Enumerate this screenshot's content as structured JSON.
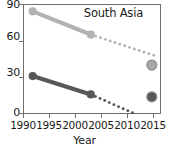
{
  "chart_data": {
    "type": "line",
    "title": "South Asia",
    "xlabel": "Year",
    "ylabel": "",
    "xlim": [
      1988,
      2016.5
    ],
    "ylim": [
      0,
      90
    ],
    "xticks": [
      1990,
      1995,
      2000,
      2005,
      2010,
      2015
    ],
    "yticks": [
      0,
      30,
      60,
      90
    ],
    "grid": false,
    "legend": "none",
    "series": [
      {
        "name": "upper-series",
        "color": "#b3b3b3",
        "style": "solid",
        "x": [
          1990,
          2002
        ],
        "values": [
          84,
          65
        ]
      },
      {
        "name": "upper-series-projection",
        "color": "#b3b3b3",
        "style": "dotted",
        "x": [
          2002,
          2015
        ],
        "values": [
          65,
          48
        ]
      },
      {
        "name": "upper-series-target",
        "color": "#a8a8a8",
        "style": "marker",
        "x": [
          2014.6
        ],
        "values": [
          40
        ]
      },
      {
        "name": "lower-series",
        "color": "#585858",
        "style": "solid",
        "x": [
          1990,
          2002
        ],
        "values": [
          31,
          16
        ]
      },
      {
        "name": "lower-series-projection",
        "color": "#585858",
        "style": "dotted",
        "x": [
          2002,
          2010.6
        ],
        "values": [
          16,
          1
        ]
      },
      {
        "name": "lower-series-target",
        "color": "#585858",
        "style": "marker",
        "x": [
          2014.6
        ],
        "values": [
          14
        ]
      }
    ]
  },
  "axes": {
    "x_tick_labels": [
      "1990",
      "1995",
      "2000",
      "2005",
      "2010",
      "2015"
    ],
    "y_tick_labels": [
      "90",
      "60",
      "30",
      "0"
    ],
    "x_title": "Year"
  },
  "title": {
    "text": "South Asia"
  },
  "colors": {
    "axis": "#6f6f6f",
    "text": "#1a1a1a",
    "series_light": "#b3b3b3",
    "series_dark": "#585858",
    "background": "#ffffff"
  }
}
